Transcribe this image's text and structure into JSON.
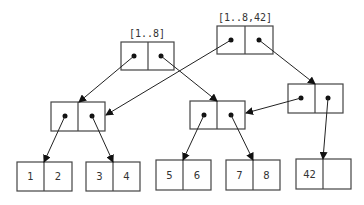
{
  "diagram": {
    "roots": [
      {
        "label": "[1..8]"
      },
      {
        "label": "[1..8,42]"
      }
    ],
    "leaves": [
      {
        "left": "1",
        "right": "2"
      },
      {
        "left": "3",
        "right": "4"
      },
      {
        "left": "5",
        "right": "6"
      },
      {
        "left": "7",
        "right": "8"
      },
      {
        "left": "42",
        "right": ""
      }
    ]
  }
}
